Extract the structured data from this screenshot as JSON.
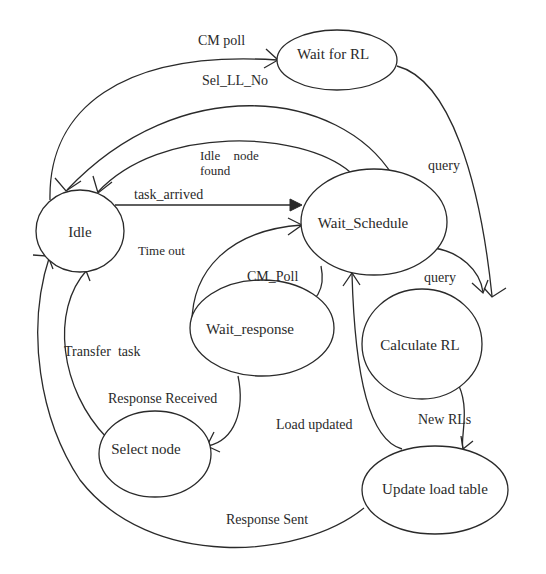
{
  "diagram": {
    "type": "state-transition",
    "colors": {
      "stroke": "#2a2a2a",
      "background": "#ffffff",
      "text": "#2a2a2a"
    },
    "states": {
      "idle": "Idle",
      "wait_for_rl": "Wait for RL",
      "wait_schedule": "Wait_Schedule",
      "wait_response": "Wait_response",
      "select_node": "Select node",
      "calculate_rl": "Calculate RL",
      "update_load_table": "Update load table"
    },
    "transitions": {
      "cm_poll_upper": {
        "label": "CM poll",
        "from": "Idle",
        "to": "Wait for RL"
      },
      "sel_ll_no": {
        "label": "Sel_LL_No",
        "from": "Wait_Schedule",
        "to": "Idle"
      },
      "idle_node_found_line1": "Idle node",
      "idle_node_found_line2": "found",
      "idle_node_found": {
        "label": "Idle node found",
        "from": "Wait_Schedule",
        "to": "Idle"
      },
      "task_arrived": {
        "label": "task_arrived",
        "from": "Idle",
        "to": "Wait_Schedule"
      },
      "time_out": {
        "label": "Time out",
        "from": "Wait_response",
        "to": "Wait_Schedule"
      },
      "cm_poll_lower": {
        "label": "CM_Poll",
        "from": "Wait_Schedule",
        "to": "Wait_response"
      },
      "query_upper": {
        "label": "query",
        "from": "Wait for RL",
        "to": "Calculate RL"
      },
      "query_lower": {
        "label": "query",
        "from": "Wait_Schedule",
        "to": "Calculate RL"
      },
      "transfer_task": {
        "label": "Transfer  task",
        "from": "Select node",
        "to": "Idle"
      },
      "response_received": {
        "label": "Response Received",
        "from": "Wait_response",
        "to": "Select node"
      },
      "load_updated": {
        "label": "Load updated",
        "from": "Update load table",
        "to": "Wait_Schedule"
      },
      "new_rls": {
        "label": "New RLs",
        "from": "Calculate RL",
        "to": "Update load table"
      },
      "response_sent": {
        "label": "Response Sent",
        "from": "Update load table",
        "to": "Idle"
      }
    }
  }
}
